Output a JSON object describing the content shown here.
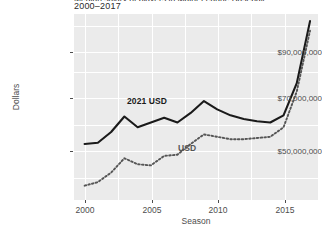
{
  "chart_data": {
    "type": "line",
    "title": "Median salary of players in Major League Baseball",
    "subtitle": "2000–2017",
    "xlabel": "Season",
    "ylabel": "Dollars",
    "xlim": [
      1999.2,
      2017.6
    ],
    "ylim": [
      28000000,
      106000000
    ],
    "grid": true,
    "legend_position": "inline-annotation",
    "x": [
      2000,
      2001,
      2002,
      2003,
      2004,
      2005,
      2006,
      2007,
      2008,
      2009,
      2010,
      2011,
      2012,
      2013,
      2014,
      2015,
      2016,
      2017
    ],
    "yticks": [
      50000000,
      70000000,
      90000000
    ],
    "ytick_labels": [
      "$50,000,000",
      "$70,000,000",
      "$90,000,000"
    ],
    "xticks": [
      2000,
      2005,
      2010,
      2015
    ],
    "xtick_labels": [
      "2000",
      "2005",
      "2010",
      "2015"
    ],
    "series": [
      {
        "name": "2021 USD",
        "label": "2021 USD",
        "style": "solid",
        "color": "#1a1a1a",
        "values": [
          51500000,
          52000000,
          56500000,
          63000000,
          58500000,
          60500000,
          62500000,
          60500000,
          64500000,
          69500000,
          66000000,
          63500000,
          62000000,
          61000000,
          60500000,
          63500000,
          77000000,
          103000000
        ]
      },
      {
        "name": "USD",
        "label": "USD",
        "style": "dotted",
        "color": "#555555",
        "values": [
          34000000,
          35500000,
          39500000,
          45500000,
          43000000,
          42500000,
          46500000,
          47000000,
          51500000,
          55500000,
          54500000,
          53500000,
          53500000,
          54000000,
          54500000,
          58500000,
          73500000,
          99000000
        ]
      }
    ],
    "annotations": [
      {
        "text": "2021 USD",
        "x": 2004.2,
        "y": 68500000
      },
      {
        "text": "USD",
        "x": 2008.3,
        "y": 51000000
      }
    ]
  }
}
